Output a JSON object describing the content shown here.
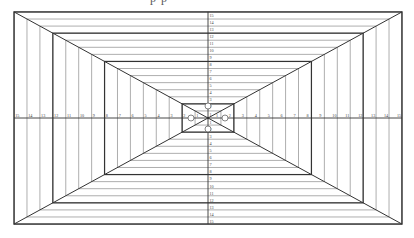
{
  "caption": {
    "text_partial": "p p"
  },
  "diagram": {
    "type": "perspective-grid",
    "levels": 15,
    "center": {
      "x": 208,
      "y": 118
    },
    "step_x": 12.93,
    "step_y": 7.07,
    "dark_levels": [
      15,
      12,
      8,
      2
    ],
    "colors": {
      "dark": "#333333",
      "light": "#999999",
      "label": "#444444",
      "circle": "#666666"
    },
    "axis_labels": {
      "left": [
        "15",
        "14",
        "13",
        "12",
        "11",
        "10",
        "9",
        "8",
        "7",
        "6",
        "5",
        "4",
        "3",
        "2",
        "1"
      ],
      "right": [
        "1",
        "2",
        "3",
        "4",
        "5",
        "6",
        "7",
        "8",
        "9",
        "10",
        "11",
        "12",
        "13",
        "14",
        "15"
      ],
      "top": [
        "15",
        "14",
        "13",
        "12",
        "11",
        "10",
        "9",
        "8",
        "7",
        "6",
        "5",
        "4",
        "3",
        "2",
        "1"
      ],
      "bottom": [
        "1",
        "2",
        "3",
        "4",
        "5",
        "6",
        "7",
        "8",
        "9",
        "10",
        "11",
        "12",
        "13",
        "14",
        "15"
      ]
    },
    "center_markers": [
      {
        "name": "top-marker",
        "dx": 0,
        "dy": -12,
        "r": 3
      },
      {
        "name": "bottom-marker",
        "dx": 0,
        "dy": 11,
        "r": 3
      },
      {
        "name": "left-marker",
        "dx": -17,
        "dy": 0,
        "r": 3
      },
      {
        "name": "right-marker",
        "dx": 17,
        "dy": 0,
        "r": 3
      }
    ]
  }
}
